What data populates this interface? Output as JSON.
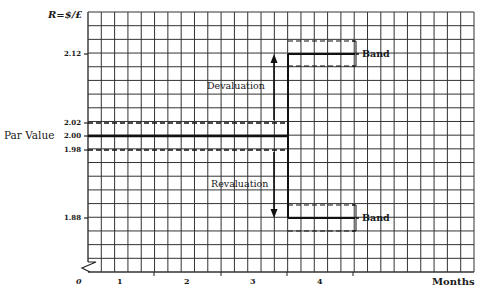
{
  "chart_data": {
    "type": "line",
    "title": "",
    "ylabel": "R=$/£",
    "xlabel": "Months",
    "x_ticks": [
      "0",
      "1",
      "2",
      "3",
      "4"
    ],
    "y_ticks": [
      "2.12",
      "2.02",
      "2.00",
      "1.98",
      "1.88"
    ],
    "ylim": [
      1.82,
      2.18
    ],
    "grid": true,
    "par_value": {
      "label": "Par Value",
      "value": 2.0,
      "upper_band": 2.02,
      "lower_band": 1.98,
      "x_range": [
        0,
        3.5
      ]
    },
    "devaluation": {
      "label": "Devaluation",
      "new_rate": 2.12,
      "band": [
        2.14,
        2.1
      ],
      "band_label": "Band",
      "x_range": [
        3.5,
        4.5
      ]
    },
    "revaluation": {
      "label": "Revaluation",
      "new_rate": 1.88,
      "band": [
        1.9,
        1.86
      ],
      "band_label": "Band",
      "x_range": [
        3.5,
        4.5
      ]
    },
    "series": [
      {
        "name": "Par Value",
        "x": [
          0,
          3.5
        ],
        "values": [
          2.0,
          2.0
        ]
      },
      {
        "name": "After devaluation",
        "x": [
          3.5,
          4.5
        ],
        "values": [
          2.12,
          2.12
        ]
      },
      {
        "name": "After revaluation",
        "x": [
          3.5,
          4.5
        ],
        "values": [
          1.88,
          1.88
        ]
      }
    ],
    "axis_break": true
  },
  "labels": {
    "ytitle": "R=$/£",
    "y212": "2.12",
    "y202": "2.02",
    "y200": "2.00",
    "y198": "1.98",
    "y188": "1.88",
    "par": "Par Value",
    "x0": "0",
    "x1": "1",
    "x2": "2",
    "x3": "3",
    "x4": "4",
    "xtitle": "Months",
    "devaluation": "Devaluation",
    "revaluation": "Revaluation",
    "band_upper": "Band",
    "band_lower": "Band"
  }
}
